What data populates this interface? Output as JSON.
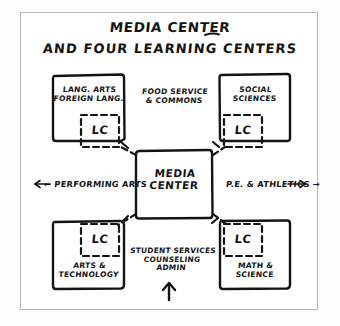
{
  "title": {
    "line1": "MEDIA CENTER",
    "line2": "AND FOUR LEARNING CENTERS"
  },
  "center": {
    "label": "MEDIA\nCENTER"
  },
  "quadrants": [
    {
      "id": "top-left",
      "label": "LANG. ARTS\nFOREIGN LANG.",
      "lc": "LC"
    },
    {
      "id": "top-right",
      "label": "SOCIAL\nSCIENCES",
      "lc": "LC"
    },
    {
      "id": "bottom-left",
      "label": "ARTS &\nTECHNOLOGY",
      "lc": "LC"
    },
    {
      "id": "bottom-right",
      "label": "MATH &\nSCIENCE",
      "lc": "LC"
    }
  ],
  "annotations": {
    "top_center": "FOOD SERVICE\n& COMMONS",
    "left_arrow": "← PERFORMING ARTS",
    "right_arrow": "P.E. & ATHLETICS →",
    "bottom_center": "STUDENT SERVICES\nCOUNSELING\nADMIN"
  },
  "colors": {
    "ink": "#141414",
    "frame": "#b8b8b4",
    "paper": "#ffffff"
  }
}
